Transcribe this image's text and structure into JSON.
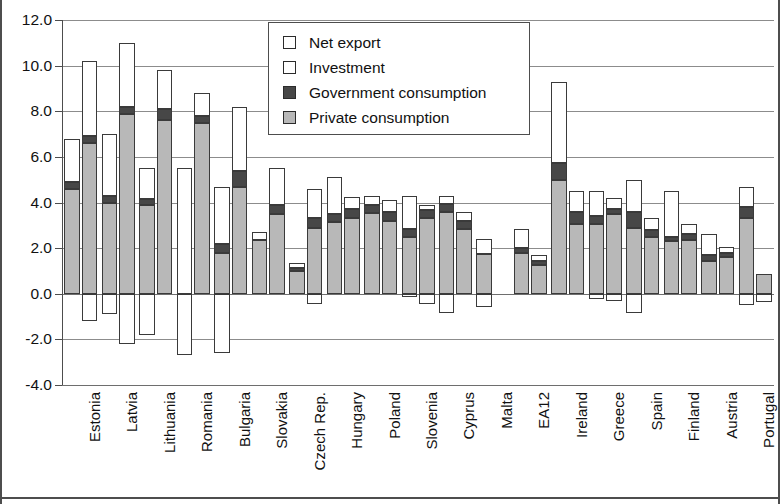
{
  "chart_data": {
    "type": "bar",
    "title": "",
    "subtitle": "",
    "xlabel": "",
    "ylabel": "",
    "ylim": [
      -4.0,
      12.0
    ],
    "ytick_values": [
      12.0,
      10.0,
      8.0,
      6.0,
      4.0,
      2.0,
      0.0,
      -2.0,
      -4.0
    ],
    "ytick_labels": [
      "12.0",
      "10.0",
      "8.0",
      "6.0",
      "4.0",
      "2.0",
      "0.0",
      "-2.0",
      "-4.0"
    ],
    "grid": true,
    "legend_position": "upper-center",
    "stacked": true,
    "bars_per_category": 2,
    "legend": [
      {
        "label": "Net export",
        "color": "#ffffff",
        "key": "net_export"
      },
      {
        "label": "Investment",
        "color": "#ffffff",
        "key": "investment"
      },
      {
        "label": "Government consumption",
        "color": "#474747",
        "key": "government_consumption"
      },
      {
        "label": "Private consumption",
        "color": "#b8b8b8",
        "key": "private_consumption"
      }
    ],
    "categories": [
      "Estonia",
      "Latvia",
      "Lithuania",
      "Romania",
      "Bulgaria",
      "Slovakia",
      "Czech Rep.",
      "Hungary",
      "Poland",
      "Slovenia",
      "Cyprus",
      "Malta",
      "EA12",
      "Ireland",
      "Greece",
      "Spain",
      "Finland",
      "Austria",
      "Portugal"
    ],
    "series": [
      {
        "name": "bar-1",
        "points": [
          {
            "category": "Estonia",
            "private_consumption": 4.6,
            "government_consumption": 0.3,
            "investment": 1.9,
            "net_export": 0.0,
            "total": 6.8,
            "negative": 0.0
          },
          {
            "category": "Latvia",
            "private_consumption": 4.0,
            "government_consumption": 0.3,
            "investment": 2.7,
            "net_export": 0.0,
            "total": 7.0,
            "negative": -0.9
          },
          {
            "category": "Lithuania",
            "private_consumption": 3.9,
            "government_consumption": 0.25,
            "investment": 1.35,
            "net_export": 0.0,
            "total": 5.5,
            "negative": -1.8
          },
          {
            "category": "Romania",
            "private_consumption": 0.0,
            "government_consumption": 0.0,
            "investment": 5.5,
            "net_export": 0.0,
            "total": 5.5,
            "negative": -2.7
          },
          {
            "category": "Bulgaria",
            "private_consumption": 1.8,
            "government_consumption": 0.4,
            "investment": 2.5,
            "net_export": 0.0,
            "total": 4.7,
            "negative": -2.6
          },
          {
            "category": "Slovakia",
            "private_consumption": 2.35,
            "government_consumption": 0.0,
            "investment": 0.35,
            "net_export": 0.0,
            "total": 2.7,
            "negative": 0.0
          },
          {
            "category": "Czech Rep.",
            "private_consumption": 1.0,
            "government_consumption": 0.15,
            "investment": 0.2,
            "net_export": 0.0,
            "total": 1.35,
            "negative": 0.0
          },
          {
            "category": "Hungary",
            "private_consumption": 3.15,
            "government_consumption": 0.35,
            "investment": 1.6,
            "net_export": 0.0,
            "total": 5.1,
            "negative": 0.0
          },
          {
            "category": "Poland",
            "private_consumption": 3.55,
            "government_consumption": 0.35,
            "investment": 0.4,
            "net_export": 0.0,
            "total": 4.3,
            "negative": 0.0
          },
          {
            "category": "Slovenia",
            "private_consumption": 2.5,
            "government_consumption": 0.35,
            "investment": 1.45,
            "net_export": 0.0,
            "total": 4.3,
            "negative": -0.15
          },
          {
            "category": "Cyprus",
            "private_consumption": 3.6,
            "government_consumption": 0.35,
            "investment": 0.35,
            "net_export": 0.0,
            "total": 4.3,
            "negative": -0.85
          },
          {
            "category": "Malta",
            "private_consumption": 1.75,
            "government_consumption": 0.0,
            "investment": 0.65,
            "net_export": 0.0,
            "total": 2.4,
            "negative": -0.6
          },
          {
            "category": "EA12",
            "private_consumption": 1.8,
            "government_consumption": 0.2,
            "investment": 0.85,
            "net_export": 0.0,
            "total": 2.85,
            "negative": 0.0
          },
          {
            "category": "Ireland",
            "private_consumption": 5.0,
            "government_consumption": 0.75,
            "investment": 3.55,
            "net_export": 0.0,
            "total": 9.3,
            "negative": 0.0
          },
          {
            "category": "Greece",
            "private_consumption": 3.05,
            "government_consumption": 0.35,
            "investment": 1.1,
            "net_export": 0.0,
            "total": 4.5,
            "negative": -0.25
          },
          {
            "category": "Spain",
            "private_consumption": 2.9,
            "government_consumption": 0.7,
            "investment": 1.4,
            "net_export": 0.0,
            "total": 5.0,
            "negative": -0.85
          },
          {
            "category": "Finland",
            "private_consumption": 2.3,
            "government_consumption": 0.2,
            "investment": 2.0,
            "net_export": 0.0,
            "total": 4.5,
            "negative": 0.0
          },
          {
            "category": "Austria",
            "private_consumption": 1.45,
            "government_consumption": 0.25,
            "investment": 0.9,
            "net_export": 0.0,
            "total": 2.6,
            "negative": 0.0
          },
          {
            "category": "Portugal",
            "private_consumption": 3.3,
            "government_consumption": 0.5,
            "investment": 0.9,
            "net_export": 0.0,
            "total": 4.7,
            "negative": -0.5
          }
        ]
      },
      {
        "name": "bar-2",
        "points": [
          {
            "category": "Estonia",
            "private_consumption": 6.6,
            "government_consumption": 0.3,
            "investment": 3.3,
            "net_export": 0.0,
            "total": 10.2,
            "negative": -1.2
          },
          {
            "category": "Latvia",
            "private_consumption": 7.9,
            "government_consumption": 0.3,
            "investment": 2.8,
            "net_export": 0.0,
            "total": 11.0,
            "negative": -2.2
          },
          {
            "category": "Lithuania",
            "private_consumption": 7.6,
            "government_consumption": 0.5,
            "investment": 1.7,
            "net_export": 0.0,
            "total": 9.8,
            "negative": 0.0
          },
          {
            "category": "Romania",
            "private_consumption": 7.5,
            "government_consumption": 0.3,
            "investment": 1.0,
            "net_export": 0.0,
            "total": 8.8,
            "negative": 0.0
          },
          {
            "category": "Bulgaria",
            "private_consumption": 4.7,
            "government_consumption": 0.7,
            "investment": 2.8,
            "net_export": 0.0,
            "total": 8.2,
            "negative": 0.0
          },
          {
            "category": "Slovakia",
            "private_consumption": 3.5,
            "government_consumption": 0.4,
            "investment": 1.6,
            "net_export": 0.0,
            "total": 5.5,
            "negative": 0.0
          },
          {
            "category": "Czech Rep.",
            "private_consumption": 2.9,
            "government_consumption": 0.4,
            "investment": 1.3,
            "net_export": 0.0,
            "total": 4.6,
            "negative": -0.45
          },
          {
            "category": "Hungary",
            "private_consumption": 3.3,
            "government_consumption": 0.4,
            "investment": 0.55,
            "net_export": 0.0,
            "total": 4.25,
            "negative": 0.0
          },
          {
            "category": "Poland",
            "private_consumption": 3.2,
            "government_consumption": 0.4,
            "investment": 0.5,
            "net_export": 0.0,
            "total": 4.1,
            "negative": 0.0
          },
          {
            "category": "Slovenia",
            "private_consumption": 3.3,
            "government_consumption": 0.35,
            "investment": 0.25,
            "net_export": 0.0,
            "total": 3.9,
            "negative": -0.45
          },
          {
            "category": "Cyprus",
            "private_consumption": 2.85,
            "government_consumption": 0.35,
            "investment": 0.4,
            "net_export": 0.0,
            "total": 3.6,
            "negative": 0.0
          },
          {
            "category": "Malta",
            "private_consumption": 0.0,
            "government_consumption": 0.0,
            "investment": 0.0,
            "net_export": 0.0,
            "total": 0.0,
            "negative": 0.0
          },
          {
            "category": "EA12",
            "private_consumption": 1.25,
            "government_consumption": 0.2,
            "investment": 0.25,
            "net_export": 0.0,
            "total": 1.7,
            "negative": 0.0
          },
          {
            "category": "Ireland",
            "private_consumption": 3.05,
            "government_consumption": 0.55,
            "investment": 0.9,
            "net_export": 0.0,
            "total": 4.5,
            "negative": 0.0
          },
          {
            "category": "Greece",
            "private_consumption": 3.5,
            "government_consumption": 0.2,
            "investment": 0.5,
            "net_export": 0.0,
            "total": 4.2,
            "negative": -0.3
          },
          {
            "category": "Spain",
            "private_consumption": 2.5,
            "government_consumption": 0.3,
            "investment": 0.5,
            "net_export": 0.0,
            "total": 3.3,
            "negative": 0.0
          },
          {
            "category": "Finland",
            "private_consumption": 2.35,
            "government_consumption": 0.25,
            "investment": 0.45,
            "net_export": 0.0,
            "total": 3.05,
            "negative": 0.0
          },
          {
            "category": "Austria",
            "private_consumption": 1.6,
            "government_consumption": 0.2,
            "investment": 0.25,
            "net_export": 0.0,
            "total": 2.05,
            "negative": 0.0
          },
          {
            "category": "Portugal",
            "private_consumption": 0.85,
            "government_consumption": 0.0,
            "investment": 0.0,
            "net_export": 0.0,
            "total": 0.85,
            "negative": -0.35
          }
        ]
      }
    ]
  },
  "colors": {
    "private_consumption": "#b8b8b8",
    "government_consumption": "#474747",
    "investment": "#ffffff",
    "net_export": "#ffffff",
    "outline": "#3a3a3a",
    "grid": "#8c8c8c",
    "axis": "#4d4d4d"
  }
}
